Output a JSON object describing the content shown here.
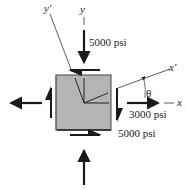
{
  "diagram": {
    "type": "plane-stress-element",
    "element_fill": "#b4b4b4",
    "element_border": "#2a2a2a",
    "arrow_color": "#1a1a1a",
    "labels": {
      "y_axis": "y",
      "y_prime_axis": "y′",
      "x_axis": "x",
      "x_prime_axis": "x′",
      "theta": "θ",
      "vertical_stress": "5000 psi",
      "horizontal_stress": "3000 psi",
      "shear_stress": "5000 psi"
    }
  }
}
